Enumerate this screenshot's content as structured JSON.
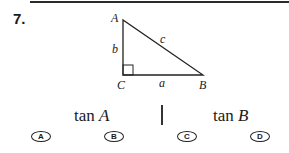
{
  "question": {
    "number": "7.",
    "figure": {
      "type": "right-triangle",
      "vertices": {
        "A": "A",
        "B": "B",
        "C": "C"
      },
      "sides": {
        "a": "a",
        "b": "b",
        "c": "c"
      },
      "right_angle_at": "C"
    },
    "prompts": [
      {
        "func": "tan",
        "var": "A"
      },
      {
        "func": "tan",
        "var": "B"
      }
    ],
    "choices": [
      "A",
      "B",
      "C",
      "D"
    ]
  }
}
